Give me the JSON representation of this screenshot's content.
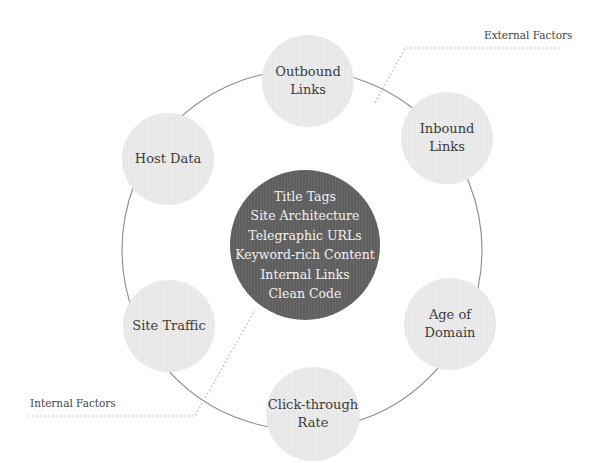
{
  "diagram": {
    "center": {
      "items": [
        "Title Tags",
        "Site Architecture",
        "Telegraphic URLs",
        "Keyword-rich Content",
        "Internal Links",
        "Clean Code"
      ]
    },
    "satellites": [
      {
        "label": "Outbound\nLinks"
      },
      {
        "label": "Inbound\nLinks"
      },
      {
        "label": "Age of\nDomain"
      },
      {
        "label": "Click-through\nRate"
      },
      {
        "label": "Site Traffic"
      },
      {
        "label": "Host Data"
      }
    ],
    "annotations": {
      "external": "External Factors",
      "internal": "Internal Factors"
    },
    "colors": {
      "core": "#5f5f5f",
      "satellite": "#e7e7e7",
      "ring": "#8a8a8a",
      "leader": "#b5b5b5"
    }
  }
}
